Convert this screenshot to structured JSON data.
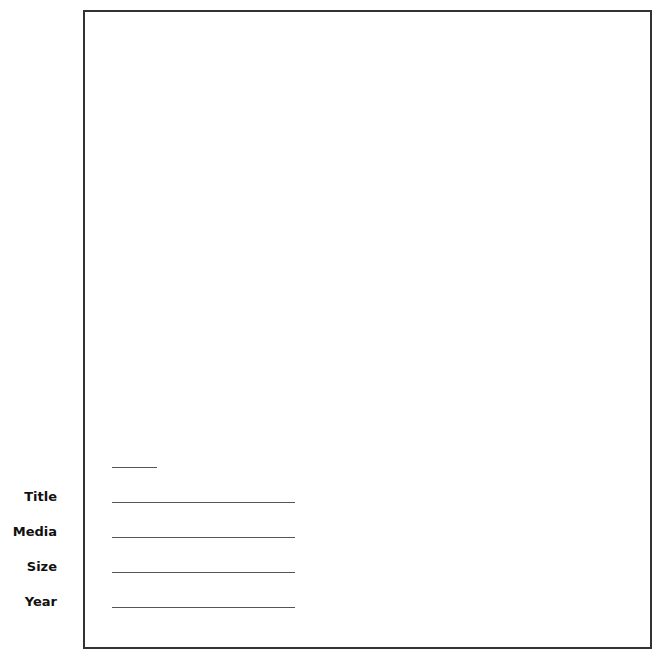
{
  "form": {
    "fields": [
      {
        "label": "Title",
        "value": ""
      },
      {
        "label": "Media",
        "value": ""
      },
      {
        "label": "Size",
        "value": ""
      },
      {
        "label": "Year",
        "value": ""
      }
    ],
    "caption_number": ""
  },
  "colors": {
    "frame": "#333333",
    "line": "#555555",
    "label": "#111111"
  }
}
